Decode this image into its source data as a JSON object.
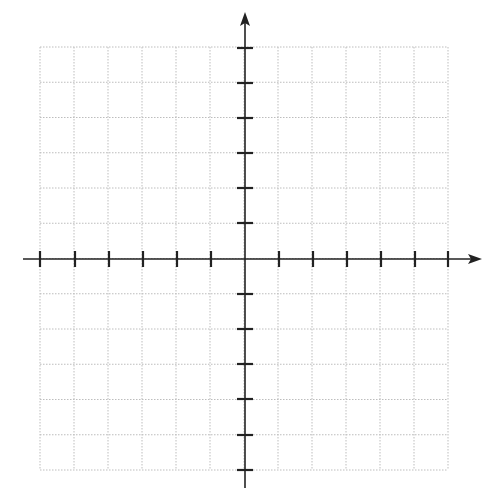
{
  "diagram": {
    "type": "coordinate-plane",
    "grid": {
      "left": 40,
      "right": 448,
      "top": 47,
      "bottom": 470,
      "cols": 12,
      "rows": 12,
      "line_color": "#bdbdbd",
      "dash": "1.5,1.5"
    },
    "axes": {
      "color": "#222222",
      "width": 1.6,
      "origin_x": 245,
      "origin_y": 259,
      "x_axis": {
        "start": 23,
        "end": 482,
        "arrow_right": true,
        "arrow_left": false
      },
      "y_axis": {
        "start": 12,
        "end": 488,
        "arrow_top": true,
        "arrow_bottom": false
      },
      "tick_length": 8,
      "tick_width": 2.2,
      "x_ticks": [
        40,
        75,
        109,
        143,
        177,
        211,
        279,
        313,
        347,
        381,
        415,
        448
      ],
      "y_ticks": [
        48,
        83,
        118,
        153,
        188,
        223,
        294,
        329,
        364,
        399,
        435,
        470
      ]
    },
    "labels": []
  }
}
